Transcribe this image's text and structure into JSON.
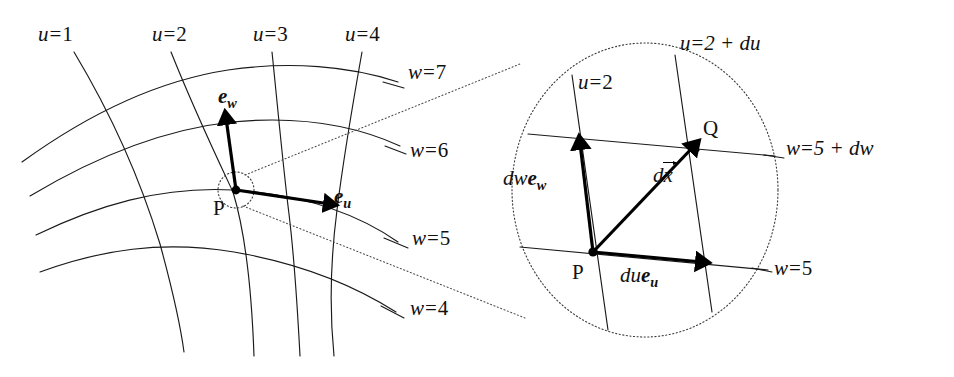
{
  "figure": {
    "background_color": "#ffffff",
    "ink_color": "#000000"
  },
  "left_panel": {
    "name": "curvilinear-grid",
    "u_curve_labels": [
      {
        "text": "u = 1",
        "var": "u",
        "op": "=",
        "value": "1"
      },
      {
        "text": "u = 2",
        "var": "u",
        "op": "=",
        "value": "2"
      },
      {
        "text": "u = 3",
        "var": "u",
        "op": "=",
        "value": "3"
      },
      {
        "text": "u = 4",
        "var": "u",
        "op": "=",
        "value": "4"
      }
    ],
    "w_curve_labels": [
      {
        "text": "w = 7",
        "var": "w",
        "op": "=",
        "value": "7"
      },
      {
        "text": "w = 6",
        "var": "w",
        "op": "=",
        "value": "6"
      },
      {
        "text": "w = 5",
        "var": "w",
        "op": "=",
        "value": "5"
      },
      {
        "text": "w = 4",
        "var": "w",
        "op": "=",
        "value": "4"
      }
    ],
    "point_label": "P",
    "basis_vectors": [
      {
        "name": "e_w",
        "symbol": "e",
        "subscript": "w"
      },
      {
        "name": "e_u",
        "symbol": "e",
        "subscript": "u"
      }
    ]
  },
  "right_panel": {
    "name": "magnified-inset",
    "u_labels": [
      {
        "text": "u = 2",
        "var": "u",
        "op": "=",
        "value": "2"
      },
      {
        "text": "u = 2 + du",
        "var": "u",
        "op": "=",
        "value": "2 + du"
      }
    ],
    "w_labels": [
      {
        "text": "w = 5 + dw",
        "var": "w",
        "op": "=",
        "value": "5 + dw"
      },
      {
        "text": "w = 5",
        "var": "w",
        "op": "=",
        "value": "5"
      }
    ],
    "point_labels": [
      "P",
      "Q"
    ],
    "displacement_vectors": [
      {
        "name": "dw-e-w",
        "prefix": "dw",
        "symbol": "e",
        "subscript": "w"
      },
      {
        "name": "du-e-u",
        "prefix": "du",
        "symbol": "e",
        "subscript": "u"
      },
      {
        "name": "dx-vector",
        "prefix": "d",
        "symbol": "x",
        "accent": "arrow"
      }
    ]
  }
}
